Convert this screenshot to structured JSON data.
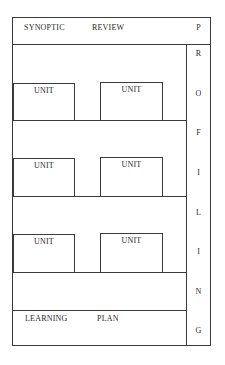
{
  "diagram": {
    "header": {
      "word1": "SYNOPTIC",
      "word2": "REVIEW"
    },
    "side_column": {
      "letters": [
        "P",
        "R",
        "O",
        "F",
        "I",
        "L",
        "I",
        "N",
        "G"
      ],
      "word": "PROFILING"
    },
    "unit_rows": [
      {
        "units": [
          {
            "label": "UNIT"
          },
          {
            "label": "UNIT"
          }
        ]
      },
      {
        "units": [
          {
            "label": "UNIT"
          },
          {
            "label": "UNIT"
          }
        ]
      },
      {
        "units": [
          {
            "label": "UNIT"
          },
          {
            "label": "UNIT"
          }
        ]
      }
    ],
    "footer": {
      "word1": "LEARNING",
      "word2": "PLAN"
    },
    "colors": {
      "line": "#3a3a3a",
      "text": "#2a2a2a",
      "background": "#ffffff"
    }
  }
}
